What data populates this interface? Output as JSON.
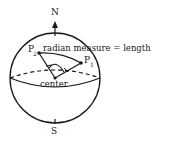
{
  "diagram": {
    "north_label": "N",
    "south_label": "S",
    "p1_label": "P",
    "p1_sub": "1",
    "p2_label": "P",
    "p2_sub": "2",
    "center_label": "center",
    "caption": "radian measure = length",
    "stroke_color": "#1a1a1a",
    "background": "#ffffff"
  }
}
